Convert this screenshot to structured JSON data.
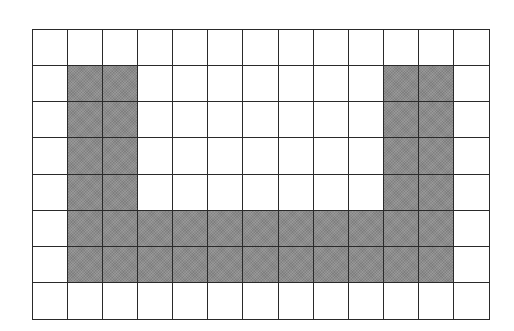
{
  "grid": {
    "rows": 8,
    "cols": 13,
    "fill_color": "#8c8c8c",
    "line_color": "#2a2a2a",
    "empty_color": "#ffffff",
    "cells": [
      [
        0,
        0,
        0,
        0,
        0,
        0,
        0,
        0,
        0,
        0,
        0,
        0,
        0
      ],
      [
        0,
        1,
        1,
        0,
        0,
        0,
        0,
        0,
        0,
        0,
        1,
        1,
        0
      ],
      [
        0,
        1,
        1,
        0,
        0,
        0,
        0,
        0,
        0,
        0,
        1,
        1,
        0
      ],
      [
        0,
        1,
        1,
        0,
        0,
        0,
        0,
        0,
        0,
        0,
        1,
        1,
        0
      ],
      [
        0,
        1,
        1,
        0,
        0,
        0,
        0,
        0,
        0,
        0,
        1,
        1,
        0
      ],
      [
        0,
        1,
        1,
        1,
        1,
        1,
        1,
        1,
        1,
        1,
        1,
        1,
        0
      ],
      [
        0,
        1,
        1,
        1,
        1,
        1,
        1,
        1,
        1,
        1,
        1,
        1,
        0
      ],
      [
        0,
        0,
        0,
        0,
        0,
        0,
        0,
        0,
        0,
        0,
        0,
        0,
        0
      ]
    ],
    "shape": "U"
  }
}
